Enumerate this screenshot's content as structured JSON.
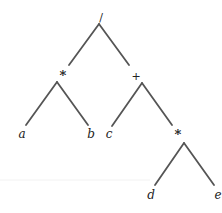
{
  "diagram": {
    "type": "expression-tree",
    "expression": "(a * b) / (c + (d * e))",
    "colors": {
      "edge": "#555555",
      "text": "#222222",
      "background": "#ffffff",
      "rule": "#f2f2f2"
    },
    "nodes": {
      "root": {
        "label": "/",
        "x": 101,
        "y": 17
      },
      "mul1": {
        "label": "*",
        "x": 63,
        "y": 75
      },
      "plus": {
        "label": "+",
        "x": 136,
        "y": 76
      },
      "a": {
        "label": "a",
        "x": 22,
        "y": 134
      },
      "b": {
        "label": "b",
        "x": 91,
        "y": 134
      },
      "c": {
        "label": "c",
        "x": 109,
        "y": 134
      },
      "mul2": {
        "label": "*",
        "x": 178,
        "y": 134
      },
      "d": {
        "label": "d",
        "x": 151,
        "y": 195
      },
      "e": {
        "label": "e",
        "x": 218,
        "y": 195
      }
    },
    "edges": [
      {
        "from": "root",
        "to": "mul1",
        "x1": 99,
        "y1": 24,
        "x2": 69,
        "y2": 65
      },
      {
        "from": "root",
        "to": "plus",
        "x1": 99,
        "y1": 24,
        "x2": 129,
        "y2": 65
      },
      {
        "from": "mul1",
        "to": "a",
        "x1": 57,
        "y1": 82,
        "x2": 26,
        "y2": 125
      },
      {
        "from": "mul1",
        "to": "b",
        "x1": 57,
        "y1": 82,
        "x2": 88,
        "y2": 125
      },
      {
        "from": "plus",
        "to": "c",
        "x1": 142,
        "y1": 83,
        "x2": 112,
        "y2": 126
      },
      {
        "from": "plus",
        "to": "mul2",
        "x1": 142,
        "y1": 83,
        "x2": 172,
        "y2": 125
      },
      {
        "from": "mul2",
        "to": "d",
        "x1": 184,
        "y1": 143,
        "x2": 155,
        "y2": 185
      },
      {
        "from": "mul2",
        "to": "e",
        "x1": 184,
        "y1": 143,
        "x2": 214,
        "y2": 185
      }
    ]
  }
}
